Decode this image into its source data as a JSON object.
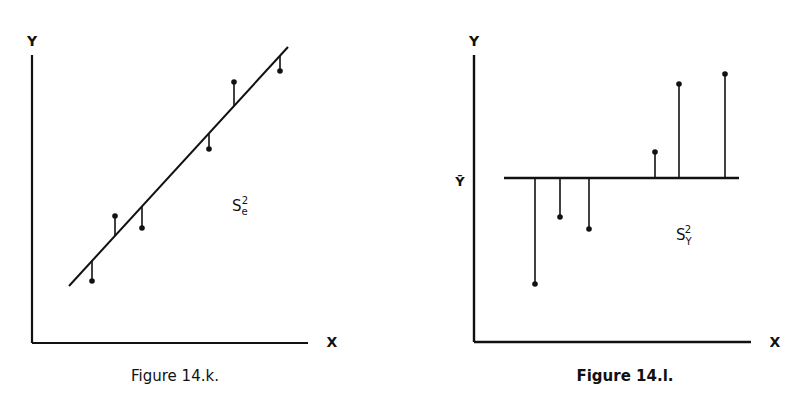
{
  "figures": [
    {
      "caption": "Figure 14.k.",
      "y_axis_label": "Y",
      "x_axis_label": "X",
      "annotation": {
        "base": "S",
        "sub": "e",
        "sup": "2"
      }
    },
    {
      "caption": "Figure 14.l.",
      "y_axis_label": "Y",
      "x_axis_label": "X",
      "mean_label": "Ȳ",
      "annotation": {
        "base": "S",
        "sub": "Y",
        "sup": "2"
      }
    }
  ],
  "chart_data": [
    {
      "type": "scatter",
      "title": "Figure 14.k.",
      "xlabel": "X",
      "ylabel": "Y",
      "description": "Scatter points with fitted regression line; vertical residual segments from each point to the line (residual variance S_e^2)",
      "grid": false,
      "regression_line": {
        "x1": 69,
        "y1": 286,
        "x2": 288,
        "y2": 47
      },
      "points": [
        {
          "x": 92,
          "y": 281,
          "line_y": 261
        },
        {
          "x": 115,
          "y": 216,
          "line_y": 236
        },
        {
          "x": 142,
          "y": 228,
          "line_y": 207
        },
        {
          "x": 209,
          "y": 149,
          "line_y": 134
        },
        {
          "x": 234,
          "y": 82,
          "line_y": 106
        },
        {
          "x": 280,
          "y": 71,
          "line_y": 56
        }
      ],
      "annotation": "S_e^2"
    },
    {
      "type": "scatter",
      "title": "Figure 14.l.",
      "xlabel": "X",
      "ylabel": "Y",
      "description": "Scatter points with horizontal mean line Ȳ; vertical deviation segments from each point to the mean (total variance S_Y^2)",
      "grid": false,
      "mean_line": {
        "x1": 504,
        "x2": 739,
        "y": 178
      },
      "points": [
        {
          "x": 535,
          "y": 284
        },
        {
          "x": 560,
          "y": 217
        },
        {
          "x": 589,
          "y": 229
        },
        {
          "x": 655,
          "y": 152
        },
        {
          "x": 679,
          "y": 84
        },
        {
          "x": 725,
          "y": 74
        }
      ],
      "annotation": "S_Y^2"
    }
  ]
}
